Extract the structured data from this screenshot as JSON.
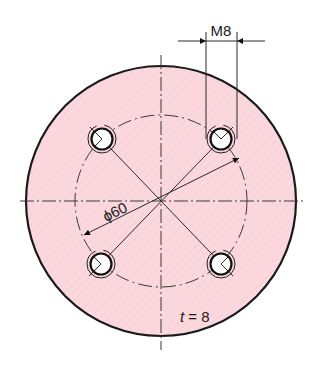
{
  "drawing": {
    "type": "technical-drawing",
    "subject": "circular flange plate with four threaded holes",
    "colors": {
      "plate_fill": "#fbd7de",
      "line": "#1a1a1a",
      "background": "#ffffff"
    },
    "dimensions": {
      "thread_label": "M8",
      "pitch_diameter_label": "ϕ60",
      "thickness_label_var": "t",
      "thickness_label_eq": " = 8"
    },
    "holes": [
      {
        "name": "top-left"
      },
      {
        "name": "top-right"
      },
      {
        "name": "bottom-left"
      },
      {
        "name": "bottom-right"
      }
    ]
  }
}
